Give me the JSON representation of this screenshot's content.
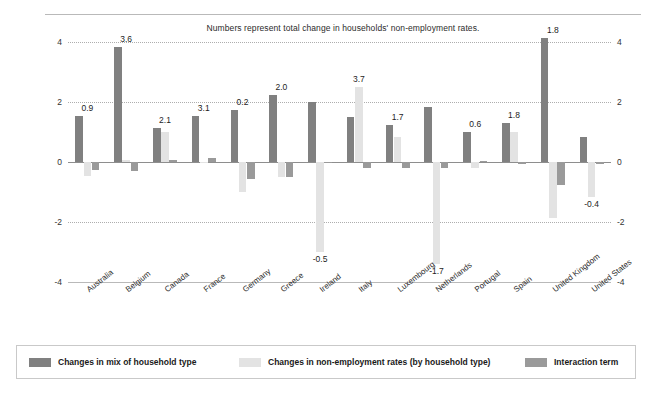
{
  "chart_data": {
    "type": "bar",
    "title": "Numbers represent total change in households' non-employment rates.",
    "xlabel": "",
    "ylabel": "",
    "ylim": [
      -4,
      4
    ],
    "yticks": [
      4,
      2,
      0,
      -2,
      -4
    ],
    "grid": true,
    "legend_position": "bottom",
    "categories": [
      "Australia",
      "Belgium",
      "Canada",
      "France",
      "Germany",
      "Greece",
      "Ireland",
      "Italy",
      "Luxembourg",
      "Netherlands",
      "Portugal",
      "Spain",
      "United Kingdom",
      "United States"
    ],
    "series": [
      {
        "name": "Changes in mix of household type",
        "color": "#808080",
        "values": [
          1.55,
          3.85,
          1.15,
          1.55,
          1.75,
          2.25,
          2.0,
          1.5,
          1.25,
          1.85,
          1.0,
          1.3,
          4.15,
          0.85
        ]
      },
      {
        "name": "Changes in non-employment rates (by household type)",
        "color": "#e3e3e3",
        "values": [
          -0.45,
          0.07,
          1.0,
          0.0,
          -1.0,
          -0.5,
          -3.0,
          2.5,
          0.85,
          -3.4,
          -0.2,
          1.0,
          -1.85,
          -1.15
        ]
      },
      {
        "name": "Interaction term",
        "color": "#9a9a9a",
        "values": [
          -0.25,
          -0.3,
          0.06,
          0.13,
          -0.55,
          -0.5,
          0.0,
          -0.2,
          -0.2,
          -0.2,
          0.04,
          -0.07,
          -0.75,
          -0.06
        ]
      }
    ],
    "total_labels": [
      {
        "category": "Australia",
        "value": "0.9",
        "position": "above"
      },
      {
        "category": "Belgium",
        "value": "3.6",
        "position": "above"
      },
      {
        "category": "Canada",
        "value": "2.1",
        "position": "above"
      },
      {
        "category": "France",
        "value": "3.1",
        "position": "above"
      },
      {
        "category": "Germany",
        "value": "0.2",
        "position": "above"
      },
      {
        "category": "Greece",
        "value": "2.0",
        "position": "above"
      },
      {
        "category": "Ireland",
        "value": "-0.5",
        "position": "below"
      },
      {
        "category": "Italy",
        "value": "3.7",
        "position": "above"
      },
      {
        "category": "Luxembourg",
        "value": "1.7",
        "position": "above"
      },
      {
        "category": "Netherlands",
        "value": "-1.7",
        "position": "below"
      },
      {
        "category": "Portugal",
        "value": "0.6",
        "position": "above"
      },
      {
        "category": "Spain",
        "value": "1.8",
        "position": "above"
      },
      {
        "category": "United Kingdom",
        "value": "1.8",
        "position": "above"
      },
      {
        "category": "United States",
        "value": "-0.4",
        "position": "below"
      }
    ]
  },
  "legend": {
    "items": [
      {
        "label": "Changes in mix of household type",
        "color": "#808080"
      },
      {
        "label": "Changes in non-employment rates (by household type)",
        "color": "#e3e3e3"
      },
      {
        "label": "Interaction term",
        "color": "#9a9a9a"
      }
    ]
  },
  "colors": {
    "series_mix": "#808080",
    "series_rates": "#e3e3e3",
    "series_interaction": "#9a9a9a",
    "gridline": "#aeaeae",
    "axis": "#8e8e8e",
    "border": "#c9c9c9",
    "background": "#ffffff"
  }
}
